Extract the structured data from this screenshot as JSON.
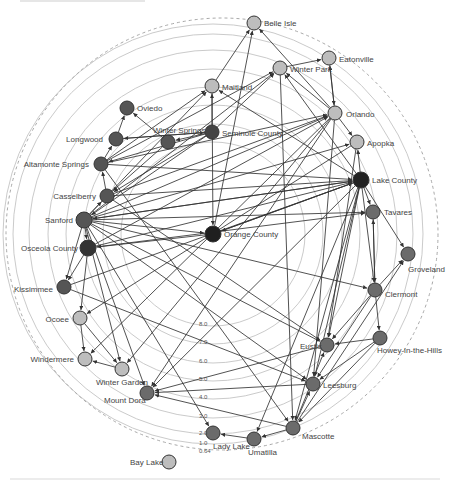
{
  "diagram": {
    "type": "radial-network",
    "center": [
      213,
      234
    ],
    "rings": {
      "labels": [
        "8.0",
        "7.0",
        "6.0",
        "5.0",
        "4.0",
        "3.0",
        "2.0",
        "1.0",
        "0.64"
      ],
      "label_positions": [
        [
          199,
          326
        ],
        [
          199,
          344
        ],
        [
          199,
          363
        ],
        [
          199,
          381
        ],
        [
          199,
          399
        ],
        [
          199,
          418
        ],
        [
          199,
          435
        ],
        [
          199,
          445
        ],
        [
          199,
          453
        ]
      ],
      "radii": [
        92,
        110,
        129,
        147,
        165,
        184,
        200,
        210
      ]
    },
    "outer_boundary_radius": 216,
    "colors": {
      "dark": "#2b2b2b",
      "medium": "#6b6b6b",
      "gray": "#8c8c8c",
      "light": "#bdbdbd",
      "edge": "#333333",
      "ring": "#c4c4c4"
    },
    "nodes": [
      {
        "id": "belle_isle",
        "label": "Belle Isle",
        "x": 254,
        "y": 23,
        "r": 7,
        "color": "#bdbdbd",
        "lx": 264,
        "ly": 26
      },
      {
        "id": "eatonville",
        "label": "Eatonville",
        "x": 329,
        "y": 58,
        "r": 7,
        "color": "#bdbdbd",
        "lx": 339,
        "ly": 62
      },
      {
        "id": "winter_park",
        "label": "Winter Park",
        "x": 280,
        "y": 68,
        "r": 7,
        "color": "#bdbdbd",
        "lx": 290,
        "ly": 72
      },
      {
        "id": "maitland",
        "label": "Maitland",
        "x": 212,
        "y": 86,
        "r": 7,
        "color": "#bdbdbd",
        "lx": 222,
        "ly": 90
      },
      {
        "id": "orlando",
        "label": "Orlando",
        "x": 335,
        "y": 113,
        "r": 7,
        "color": "#bdbdbd",
        "lx": 346,
        "ly": 117
      },
      {
        "id": "apopka",
        "label": "Apopka",
        "x": 357,
        "y": 142,
        "r": 7,
        "color": "#bdbdbd",
        "lx": 367,
        "ly": 146
      },
      {
        "id": "oviedo",
        "label": "Oviedo",
        "x": 127,
        "y": 108,
        "r": 7,
        "color": "#555555",
        "lx": 137,
        "ly": 111
      },
      {
        "id": "longwood",
        "label": "Longwood",
        "x": 116,
        "y": 139,
        "r": 7,
        "color": "#555555",
        "lx": 103,
        "ly": 142,
        "anchor": "end"
      },
      {
        "id": "winter_springs",
        "label": "Winter Springs",
        "x": 168,
        "y": 142,
        "r": 7,
        "color": "#555555",
        "lx": 153,
        "ly": 133
      },
      {
        "id": "seminole_county",
        "label": "Seminole County",
        "x": 212,
        "y": 132,
        "r": 7,
        "color": "#444444",
        "lx": 222,
        "ly": 136
      },
      {
        "id": "altamonte_springs",
        "label": "Altamonte Springs",
        "x": 101,
        "y": 164,
        "r": 7,
        "color": "#555555",
        "lx": 89,
        "ly": 167,
        "anchor": "end"
      },
      {
        "id": "lake_county",
        "label": "Lake County",
        "x": 361,
        "y": 180,
        "r": 8,
        "color": "#222222",
        "lx": 372,
        "ly": 183
      },
      {
        "id": "casselberry",
        "label": "Casselberry",
        "x": 107,
        "y": 196,
        "r": 7,
        "color": "#555555",
        "lx": 96,
        "ly": 199,
        "anchor": "end"
      },
      {
        "id": "tavares",
        "label": "Tavares",
        "x": 373,
        "y": 212,
        "r": 7,
        "color": "#6b6b6b",
        "lx": 384,
        "ly": 215
      },
      {
        "id": "sanford",
        "label": "Sanford",
        "x": 84,
        "y": 220,
        "r": 8,
        "color": "#555555",
        "lx": 73,
        "ly": 223,
        "anchor": "end"
      },
      {
        "id": "orange_county",
        "label": "Orange County",
        "x": 213,
        "y": 234,
        "r": 8,
        "color": "#1f1f1f",
        "lx": 224,
        "ly": 237
      },
      {
        "id": "osceola_county",
        "label": "Osceola County",
        "x": 88,
        "y": 248,
        "r": 8,
        "color": "#333333",
        "lx": 78,
        "ly": 251,
        "anchor": "end"
      },
      {
        "id": "groveland",
        "label": "Groveland",
        "x": 408,
        "y": 254,
        "r": 7,
        "color": "#6b6b6b",
        "lx": 408,
        "ly": 272
      },
      {
        "id": "clermont",
        "label": "Clermont",
        "x": 375,
        "y": 290,
        "r": 7,
        "color": "#6b6b6b",
        "lx": 385,
        "ly": 297
      },
      {
        "id": "kissimmee",
        "label": "Kissimmee",
        "x": 64,
        "y": 287,
        "r": 7,
        "color": "#555555",
        "lx": 53,
        "ly": 292,
        "anchor": "end"
      },
      {
        "id": "ocoee",
        "label": "Ocoee",
        "x": 80,
        "y": 318,
        "r": 7,
        "color": "#bdbdbd",
        "lx": 69,
        "ly": 322,
        "anchor": "end"
      },
      {
        "id": "howey",
        "label": "Howey-in-the-Hills",
        "x": 380,
        "y": 338,
        "r": 7,
        "color": "#6b6b6b",
        "lx": 377,
        "ly": 353
      },
      {
        "id": "eustis",
        "label": "Eustis",
        "x": 327,
        "y": 345,
        "r": 7,
        "color": "#6b6b6b",
        "lx": 300,
        "ly": 349
      },
      {
        "id": "windermere",
        "label": "Windermere",
        "x": 85,
        "y": 359,
        "r": 7,
        "color": "#bdbdbd",
        "lx": 74,
        "ly": 362,
        "anchor": "end"
      },
      {
        "id": "winter_garden",
        "label": "Winter Garden",
        "x": 122,
        "y": 369,
        "r": 7,
        "color": "#bdbdbd",
        "lx": 96,
        "ly": 385
      },
      {
        "id": "leesburg",
        "label": "Leesburg",
        "x": 313,
        "y": 384,
        "r": 7,
        "color": "#6b6b6b",
        "lx": 323,
        "ly": 388
      },
      {
        "id": "mount_dora",
        "label": "Mount Dora",
        "x": 147,
        "y": 393,
        "r": 7,
        "color": "#6b6b6b",
        "lx": 104,
        "ly": 403
      },
      {
        "id": "mascotte",
        "label": "Mascotte",
        "x": 293,
        "y": 428,
        "r": 7,
        "color": "#6b6b6b",
        "lx": 302,
        "ly": 439
      },
      {
        "id": "lady_lake",
        "label": "Lady Lake",
        "x": 213,
        "y": 433,
        "r": 7,
        "color": "#6b6b6b",
        "lx": 213,
        "ly": 449
      },
      {
        "id": "umatilla",
        "label": "Umatilla",
        "x": 254,
        "y": 439,
        "r": 7,
        "color": "#6b6b6b",
        "lx": 248,
        "ly": 455
      },
      {
        "id": "bay_lake",
        "label": "Bay Lake",
        "x": 169,
        "y": 462,
        "r": 7,
        "color": "#bdbdbd",
        "lx": 130,
        "ly": 465
      }
    ],
    "edges": [
      [
        "maitland",
        "belle_isle"
      ],
      [
        "orlando",
        "belle_isle"
      ],
      [
        "winter_park",
        "eatonville"
      ],
      [
        "orlando",
        "eatonville"
      ],
      [
        "eatonville",
        "orlando"
      ],
      [
        "orlando",
        "winter_park"
      ],
      [
        "seminole_county",
        "winter_park"
      ],
      [
        "sanford",
        "winter_park"
      ],
      [
        "altamonte_springs",
        "winter_park"
      ],
      [
        "orange_county",
        "belle_isle"
      ],
      [
        "seminole_county",
        "maitland"
      ],
      [
        "altamonte_springs",
        "maitland"
      ],
      [
        "sanford",
        "maitland"
      ],
      [
        "lake_county",
        "winter_park"
      ],
      [
        "lake_county",
        "maitland"
      ],
      [
        "winter_springs",
        "oviedo"
      ],
      [
        "longwood",
        "oviedo"
      ],
      [
        "orlando",
        "apopka"
      ],
      [
        "lake_county",
        "apopka"
      ],
      [
        "sanford",
        "apopka"
      ],
      [
        "seminole_county",
        "winter_springs"
      ],
      [
        "longwood",
        "seminole_county"
      ],
      [
        "altamonte_springs",
        "longwood"
      ],
      [
        "casselberry",
        "altamonte_springs"
      ],
      [
        "sanford",
        "casselberry"
      ],
      [
        "seminole_county",
        "casselberry"
      ],
      [
        "seminole_county",
        "altamonte_springs"
      ],
      [
        "seminole_county",
        "sanford"
      ],
      [
        "seminole_county",
        "longwood"
      ],
      [
        "winter_springs",
        "casselberry"
      ],
      [
        "sanford",
        "orange_county"
      ],
      [
        "osceola_county",
        "orlando"
      ],
      [
        "sanford",
        "orlando"
      ],
      [
        "casselberry",
        "orlando"
      ],
      [
        "altamonte_springs",
        "orlando"
      ],
      [
        "sanford",
        "lake_county"
      ],
      [
        "casselberry",
        "lake_county"
      ],
      [
        "osceola_county",
        "lake_county"
      ],
      [
        "altamonte_springs",
        "lake_county"
      ],
      [
        "sanford",
        "tavares"
      ],
      [
        "lake_county",
        "sanford"
      ],
      [
        "lake_county",
        "orange_county"
      ],
      [
        "lake_county",
        "tavares"
      ],
      [
        "lake_county",
        "groveland"
      ],
      [
        "lake_county",
        "clermont"
      ],
      [
        "lake_county",
        "eustis"
      ],
      [
        "lake_county",
        "leesburg"
      ],
      [
        "lake_county",
        "mascotte"
      ],
      [
        "lake_county",
        "mount_dora"
      ],
      [
        "lake_county",
        "umatilla"
      ],
      [
        "tavares",
        "clermont"
      ],
      [
        "clermont",
        "tavares"
      ],
      [
        "clermont",
        "groveland"
      ],
      [
        "clermont",
        "howey"
      ],
      [
        "mascotte",
        "groveland"
      ],
      [
        "sanford",
        "osceola_county"
      ],
      [
        "osceola_county",
        "kissimmee"
      ],
      [
        "sanford",
        "kissimmee"
      ],
      [
        "sanford",
        "clermont"
      ],
      [
        "sanford",
        "eustis"
      ],
      [
        "sanford",
        "leesburg"
      ],
      [
        "sanford",
        "lady_lake"
      ],
      [
        "sanford",
        "mount_dora"
      ],
      [
        "sanford",
        "winter_garden"
      ],
      [
        "ocoee",
        "windermere"
      ],
      [
        "ocoee",
        "winter_garden"
      ],
      [
        "osceola_county",
        "ocoee"
      ],
      [
        "winter_garden",
        "windermere"
      ],
      [
        "orlando",
        "windermere"
      ],
      [
        "orlando",
        "winter_garden"
      ],
      [
        "orlando",
        "mount_dora"
      ],
      [
        "howey",
        "eustis"
      ],
      [
        "howey",
        "leesburg"
      ],
      [
        "howey",
        "mascotte"
      ],
      [
        "clermont",
        "eustis"
      ],
      [
        "clermont",
        "leesburg"
      ],
      [
        "mascotte",
        "eustis"
      ],
      [
        "mascotte",
        "leesburg"
      ],
      [
        "mascotte",
        "umatilla"
      ],
      [
        "mascotte",
        "mount_dora"
      ],
      [
        "umatilla",
        "lady_lake"
      ],
      [
        "leesburg",
        "mount_dora"
      ],
      [
        "eustis",
        "mount_dora"
      ],
      [
        "orange_county",
        "lake_county"
      ],
      [
        "orange_county",
        "osceola_county"
      ],
      [
        "kissimmee",
        "lake_county"
      ],
      [
        "osceola_county",
        "tavares"
      ],
      [
        "apopka",
        "ocoee"
      ],
      [
        "maitland",
        "orange_county"
      ],
      [
        "winter_park",
        "mascotte"
      ],
      [
        "orlando",
        "leesburg"
      ],
      [
        "apopka",
        "eustis"
      ],
      [
        "casselberry",
        "eustis"
      ],
      [
        "altamonte_springs",
        "mascotte"
      ],
      [
        "kissimmee",
        "leesburg"
      ]
    ]
  }
}
